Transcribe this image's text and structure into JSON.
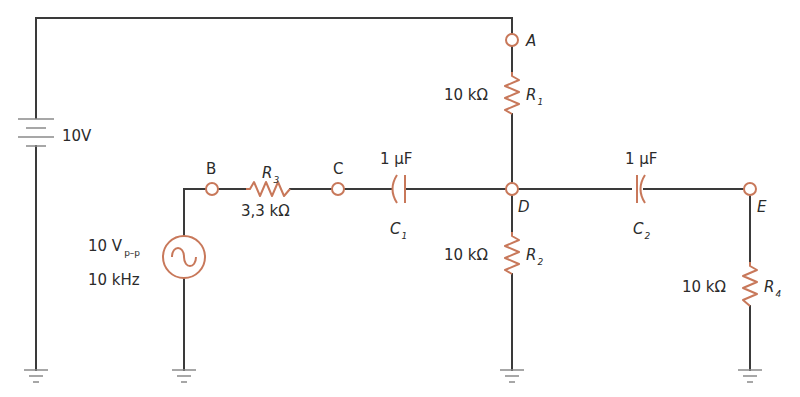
{
  "diagram": {
    "type": "electronic-circuit-schematic",
    "colors": {
      "wire": "#3a3a3a",
      "component": "#c8785a",
      "ground": "#8a8a8a",
      "text": "#2b2b2b",
      "background": "#ffffff"
    },
    "dc_source": {
      "label": "10V"
    },
    "ac_source": {
      "amplitude": "10 V",
      "amplitude_sub": "p–p",
      "frequency": "10 kHz"
    },
    "nodes": {
      "A": "A",
      "B": "B",
      "C": "C",
      "D": "D",
      "E": "E"
    },
    "resistors": {
      "R1": {
        "name": "R",
        "sub": "1",
        "value": "10 kΩ"
      },
      "R2": {
        "name": "R",
        "sub": "2",
        "value": "10 kΩ"
      },
      "R3": {
        "name": "R",
        "sub": "3",
        "value": "3,3 kΩ"
      },
      "R4": {
        "name": "R",
        "sub": "4",
        "value": "10 kΩ"
      }
    },
    "capacitors": {
      "C1": {
        "name": "C",
        "sub": "1",
        "value": "1 μF"
      },
      "C2": {
        "name": "C",
        "sub": "2",
        "value": "1 μF"
      }
    }
  }
}
